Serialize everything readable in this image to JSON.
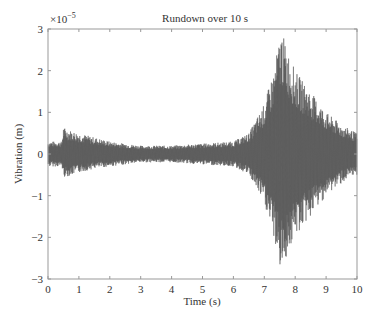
{
  "chart_data": {
    "type": "line",
    "title": "Rundown over 10 s",
    "xlabel": "Time (s)",
    "ylabel": "Vibration (m)",
    "y_multiplier": "×10⁻⁵",
    "xlim": [
      0,
      10
    ],
    "ylim": [
      -3,
      3
    ],
    "xticks": [
      0,
      1,
      2,
      3,
      4,
      5,
      6,
      7,
      8,
      9,
      10
    ],
    "yticks": [
      -3,
      -2,
      -1,
      0,
      1,
      2,
      3
    ],
    "grid": false,
    "legend": null,
    "series": [
      {
        "name": "Vibration",
        "color": "#555555",
        "description": "Oscillating vibration signal (x1e-5 m); envelope upper/lower",
        "envelope": {
          "t": [
            0.0,
            0.45,
            0.5,
            0.6,
            1.0,
            1.5,
            2.0,
            3.0,
            4.0,
            5.0,
            6.0,
            6.5,
            7.0,
            7.3,
            7.55,
            7.7,
            8.0,
            8.5,
            9.0,
            9.5,
            10.0
          ],
          "upper": [
            0.3,
            0.3,
            0.65,
            0.6,
            0.5,
            0.4,
            0.3,
            0.2,
            0.2,
            0.25,
            0.3,
            0.5,
            1.2,
            2.0,
            3.0,
            2.6,
            2.0,
            1.5,
            1.0,
            0.7,
            0.5
          ],
          "lower": [
            -0.3,
            -0.3,
            -0.55,
            -0.55,
            -0.45,
            -0.35,
            -0.3,
            -0.2,
            -0.2,
            -0.25,
            -0.3,
            -0.5,
            -1.2,
            -2.0,
            -2.9,
            -2.5,
            -2.0,
            -1.5,
            -1.0,
            -0.7,
            -0.5
          ]
        }
      }
    ]
  },
  "labels": {
    "title": "Rundown over 10 s",
    "xlabel": "Time (s)",
    "ylabel": "Vibration (m)",
    "multiplier_base": "×10",
    "multiplier_exp": "−5",
    "xticks": [
      "0",
      "1",
      "2",
      "3",
      "4",
      "5",
      "6",
      "7",
      "8",
      "9",
      "10"
    ],
    "yticks": [
      "3",
      "2",
      "1",
      "0",
      "−1",
      "−2",
      "−3"
    ]
  }
}
